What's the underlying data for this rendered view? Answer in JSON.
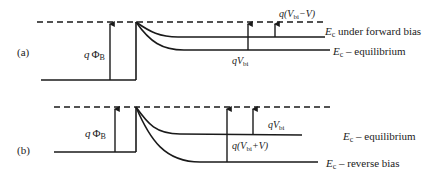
{
  "panel_a": {
    "label": "(a)",
    "barrier_label_q": "q",
    "barrier_label_phi": "Φ",
    "barrier_label_sub": "B",
    "forward_label_pre": "q(V",
    "forward_label_sub": "bi",
    "forward_label_post": "−V)",
    "vbi_label_pre": "qV",
    "vbi_label_sub": "bi",
    "curve_upper_label_E": "E",
    "curve_upper_label_sub": "c",
    "curve_upper_label_text": " under forward bias",
    "curve_lower_label_E": "E",
    "curve_lower_label_sub": "c",
    "curve_lower_label_text": " – equilibrium"
  },
  "panel_b": {
    "label": "(b)",
    "barrier_label_q": "q",
    "barrier_label_phi": "Φ",
    "barrier_label_sub": "B",
    "vbi_label_pre": "qV",
    "vbi_label_sub": "bi",
    "reverse_label_pre": "q(V",
    "reverse_label_sub": "bi",
    "reverse_label_post": "+V)",
    "curve_upper_label_E": "E",
    "curve_upper_label_sub": "c",
    "curve_upper_label_text": " – equilibrium",
    "curve_lower_label_E": "E",
    "curve_lower_label_sub": "c",
    "curve_lower_label_text": " – reverse bias"
  },
  "colors": {
    "line": "#1a1a1a",
    "text": "#222222",
    "background": "#ffffff"
  }
}
